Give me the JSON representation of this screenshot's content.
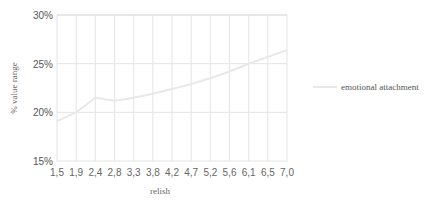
{
  "chart_data": {
    "type": "line",
    "title": "",
    "xlabel": "relish",
    "ylabel": "% value range",
    "categories": [
      "1,5",
      "1,9",
      "2,4",
      "2,8",
      "3,3",
      "3,8",
      "4,2",
      "4,7",
      "5,2",
      "5,6",
      "6,1",
      "6,5",
      "7,0"
    ],
    "series": [
      {
        "name": "emotional attachment",
        "color": "#e8e8e8",
        "values": [
          19.1,
          20.0,
          21.5,
          21.2,
          21.5,
          21.9,
          22.4,
          22.9,
          23.5,
          24.2,
          25.0,
          25.7,
          26.4
        ]
      }
    ],
    "ylim": [
      15,
      30
    ],
    "yticks": [
      "15%",
      "20%",
      "25%",
      "30%"
    ],
    "ytick_values": [
      15,
      20,
      25,
      30
    ],
    "grid": true,
    "legend_position": "right"
  },
  "legend": {
    "label": "emotional attachment"
  },
  "axes": {
    "xlabel": "relish",
    "ylabel": "% value range"
  }
}
